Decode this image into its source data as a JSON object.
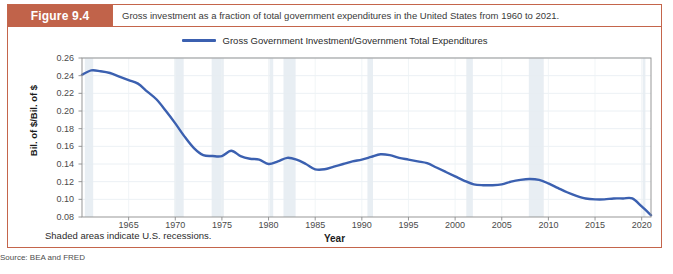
{
  "figure": {
    "tag": "Figure 9.4",
    "caption": "Gross investment as a fraction of total government expenditures in the United States from 1960 to 2021.",
    "source": "Source: BEA and FRED",
    "recession_note": "Shaded areas indicate U.S. recessions.",
    "accent_color": "#c1634a",
    "border_color": "#c4654b"
  },
  "chart_data": {
    "type": "line",
    "title": "Gross investment as a fraction of total government expenditures in the United States from 1960 to 2021.",
    "xlabel": "Year",
    "ylabel": "Bil. of $/Bil. of $",
    "xlim": [
      1960,
      2021
    ],
    "ylim": [
      0.08,
      0.26
    ],
    "grid": true,
    "legend_position": "top-center",
    "line_color": "#3b60b0",
    "recession_band_color": "#e8eef3",
    "xticks": [
      1965,
      1970,
      1975,
      1980,
      1985,
      1990,
      1995,
      2000,
      2005,
      2010,
      2015,
      2020
    ],
    "yticks": [
      0.08,
      0.1,
      0.12,
      0.14,
      0.16,
      0.18,
      0.2,
      0.22,
      0.24,
      0.26
    ],
    "ytick_labels": [
      "0.08",
      "0.10",
      "0.12",
      "0.14",
      "0.16",
      "0.18",
      "0.20",
      "0.22",
      "0.24",
      "0.26"
    ],
    "series": [
      {
        "name": "Gross Government Investment/Government Total Expenditures",
        "x": [
          1960,
          1961,
          1962,
          1963,
          1964,
          1965,
          1966,
          1967,
          1968,
          1969,
          1970,
          1971,
          1972,
          1973,
          1974,
          1975,
          1976,
          1977,
          1978,
          1979,
          1980,
          1981,
          1982,
          1983,
          1984,
          1985,
          1986,
          1987,
          1988,
          1989,
          1990,
          1991,
          1992,
          1993,
          1994,
          1995,
          1996,
          1997,
          1998,
          1999,
          2000,
          2001,
          2002,
          2003,
          2004,
          2005,
          2006,
          2007,
          2008,
          2009,
          2010,
          2011,
          2012,
          2013,
          2014,
          2015,
          2016,
          2017,
          2018,
          2019,
          2020,
          2021
        ],
        "values": [
          0.241,
          0.246,
          0.245,
          0.243,
          0.239,
          0.235,
          0.231,
          0.222,
          0.213,
          0.2,
          0.186,
          0.171,
          0.158,
          0.15,
          0.149,
          0.149,
          0.155,
          0.149,
          0.146,
          0.145,
          0.14,
          0.143,
          0.147,
          0.145,
          0.14,
          0.134,
          0.134,
          0.137,
          0.14,
          0.143,
          0.145,
          0.148,
          0.151,
          0.15,
          0.147,
          0.145,
          0.143,
          0.141,
          0.136,
          0.131,
          0.126,
          0.121,
          0.117,
          0.116,
          0.116,
          0.117,
          0.12,
          0.122,
          0.123,
          0.123,
          0.123,
          0.122,
          0.121,
          0.122,
          0.123,
          0.122,
          0.119,
          0.116,
          0.113,
          0.11,
          0.106,
          0.103
        ]
      }
    ],
    "late_detail": {
      "note": "Series continues with decline and sharp drop near 2020",
      "x": [
        2009,
        2010,
        2011,
        2012,
        2013,
        2014,
        2015,
        2016,
        2017,
        2018,
        2019,
        2020,
        2021
      ],
      "values": [
        0.122,
        0.118,
        0.113,
        0.108,
        0.104,
        0.101,
        0.1,
        0.1,
        0.101,
        0.101,
        0.101,
        0.092,
        0.082
      ]
    },
    "recessions": [
      {
        "start": 1960.3,
        "end": 1961.2
      },
      {
        "start": 1969.9,
        "end": 1970.9
      },
      {
        "start": 1973.9,
        "end": 1975.2
      },
      {
        "start": 1980.1,
        "end": 1980.5
      },
      {
        "start": 1981.6,
        "end": 1982.9
      },
      {
        "start": 1990.6,
        "end": 1991.2
      },
      {
        "start": 2001.2,
        "end": 2001.9
      },
      {
        "start": 2007.9,
        "end": 2009.5
      },
      {
        "start": 2020.1,
        "end": 2020.4
      }
    ]
  }
}
